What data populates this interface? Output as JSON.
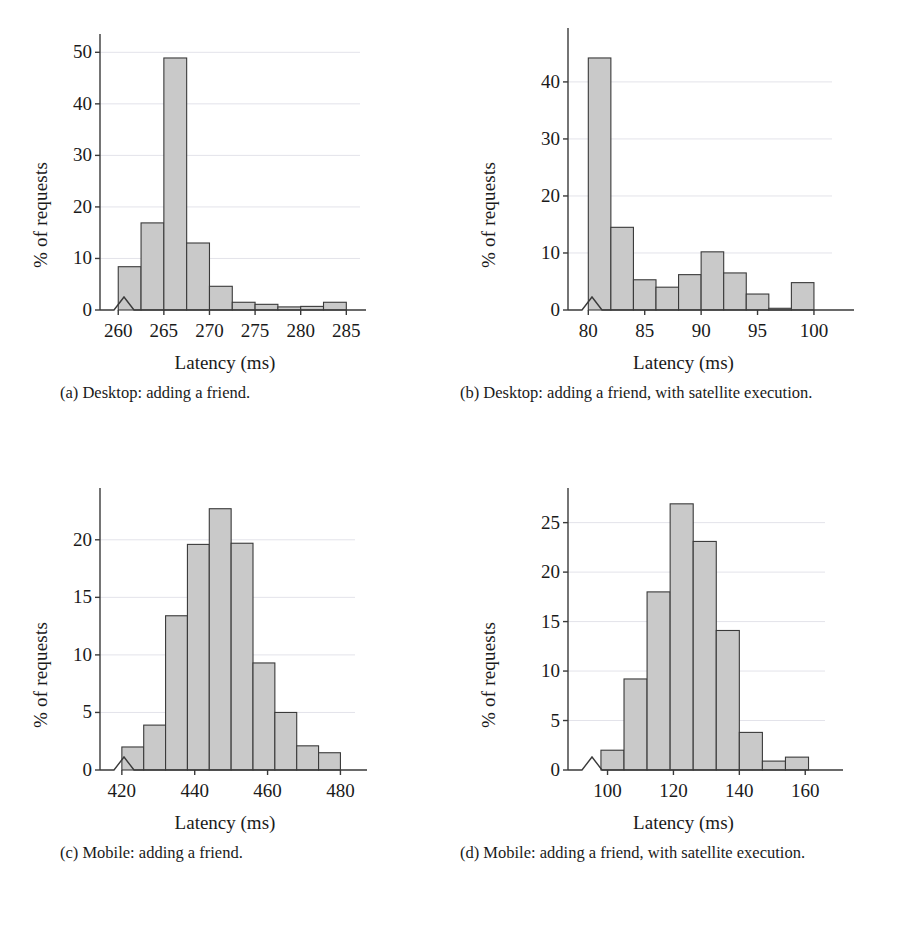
{
  "figure": {
    "panels": [
      {
        "id": "a",
        "caption": "(a) Desktop: adding a friend.",
        "chart_data": {
          "type": "bar",
          "title": "",
          "xlabel": "Latency (ms)",
          "ylabel": "% of requests",
          "xlim": [
            258.0,
            286.5
          ],
          "ylim": [
            0,
            52
          ],
          "xticks": [
            260,
            265,
            270,
            275,
            280,
            285
          ],
          "yticks": [
            0,
            10,
            20,
            30,
            40,
            50
          ],
          "grid": true,
          "axis_break": true,
          "bin_edges": [
            260.0,
            262.5,
            265.0,
            267.5,
            270.0,
            272.5,
            275.0,
            277.5,
            280.0,
            282.5,
            285.0
          ],
          "categories": [
            "260.0-262.5",
            "262.5-265.0",
            "265.0-267.5",
            "267.5-270.0",
            "270.0-272.5",
            "272.5-275.0",
            "275.0-277.5",
            "277.5-280.0",
            "280.0-282.5",
            "282.5-285.0"
          ],
          "values": [
            8.4,
            16.9,
            48.9,
            13.0,
            4.6,
            1.5,
            1.1,
            0.6,
            0.7,
            1.5
          ]
        }
      },
      {
        "id": "b",
        "caption": "(b) Desktop: adding a friend, with satellite execution.",
        "chart_data": {
          "type": "bar",
          "title": "",
          "xlabel": "Latency (ms)",
          "ylabel": "% of requests",
          "xlim": [
            78.2,
            101.6
          ],
          "ylim": [
            0,
            47
          ],
          "xticks": [
            80,
            85,
            90,
            95,
            100
          ],
          "yticks": [
            0,
            10,
            20,
            30,
            40
          ],
          "grid": true,
          "axis_break": true,
          "bin_edges": [
            80,
            82,
            84,
            86,
            88,
            90,
            92,
            94,
            96,
            98,
            100
          ],
          "categories": [
            "80-82",
            "82-84",
            "84-86",
            "86-88",
            "88-90",
            "90-92",
            "92-94",
            "94-96",
            "96-98",
            "98-100"
          ],
          "values": [
            44.2,
            14.5,
            5.3,
            4.0,
            6.2,
            10.2,
            6.5,
            2.8,
            0.3,
            4.8
          ]
        }
      },
      {
        "id": "c",
        "caption": "(c) Mobile: adding a friend.",
        "chart_data": {
          "type": "bar",
          "title": "",
          "xlabel": "Latency (ms)",
          "ylabel": "% of requests",
          "xlim": [
            414.0,
            484.0
          ],
          "ylim": [
            0,
            24.5
          ],
          "xticks": [
            420,
            440,
            460,
            480
          ],
          "yticks": [
            0,
            5,
            10,
            15,
            20
          ],
          "grid": true,
          "axis_break": true,
          "bin_edges": [
            420,
            426,
            432,
            438,
            444,
            450,
            456,
            462,
            468,
            474,
            480
          ],
          "categories": [
            "420-426",
            "426-432",
            "432-438",
            "438-444",
            "444-450",
            "450-456",
            "456-462",
            "462-468",
            "468-474",
            "474-480"
          ],
          "values": [
            2.0,
            3.9,
            13.4,
            19.6,
            22.7,
            19.7,
            9.3,
            5.0,
            2.1,
            1.5
          ]
        }
      },
      {
        "id": "d",
        "caption": "(d) Mobile: adding a friend, with satellite execution.",
        "chart_data": {
          "type": "bar",
          "title": "",
          "xlabel": "Latency (ms)",
          "ylabel": "% of requests",
          "xlim": [
            88.0,
            166.0
          ],
          "ylim": [
            0,
            28.5
          ],
          "xticks": [
            100,
            120,
            140,
            160
          ],
          "yticks": [
            0,
            5,
            10,
            15,
            20,
            25
          ],
          "grid": true,
          "axis_break": true,
          "bin_edges": [
            98,
            105,
            112,
            119,
            126,
            133,
            140,
            147,
            154,
            161
          ],
          "categories": [
            "98-105",
            "105-112",
            "112-119",
            "119-126",
            "126-133",
            "133-140",
            "140-147",
            "147-154",
            "154-161"
          ],
          "values": [
            2.0,
            9.2,
            18.0,
            26.9,
            23.1,
            14.1,
            3.8,
            0.9,
            1.3
          ]
        }
      }
    ],
    "style": {
      "bar_fill": "#c9c9c9",
      "bar_stroke": "#3a3a3a",
      "axis_color": "#3a3a3a",
      "grid_color": "#e3e3ea",
      "text_color": "#1a1a1a"
    }
  }
}
